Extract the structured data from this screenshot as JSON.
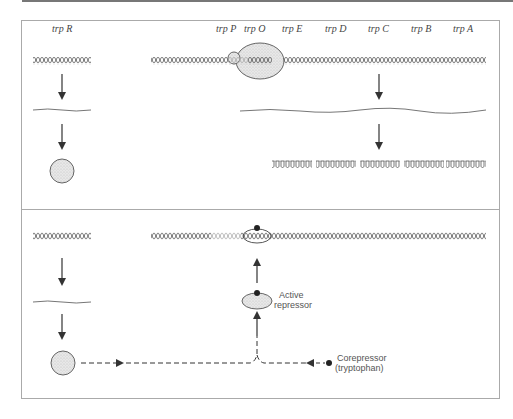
{
  "figure": {
    "top_panel": {
      "title": "Repressor inactive (no tryptophan)",
      "regulator_gene": {
        "label": "trp R"
      },
      "operon_labels": [
        "trp P",
        "trp O",
        "trp E",
        "trp D",
        "trp C",
        "trp B",
        "trp A"
      ],
      "polypeptide_count": 5
    },
    "bottom_panel": {
      "active_repressor_label_line1": "Active",
      "active_repressor_label_line2": "repressor",
      "corepressor_label_line1": "Corepressor",
      "corepressor_label_line2": "(tryptophan)"
    },
    "colors": {
      "dna_dark": "#555555",
      "dna_light": "#aaaaaa",
      "protein_fill": "#e3e3e3",
      "border": "#aaaaaa",
      "arrow": "#333333",
      "dot": "#222222"
    }
  }
}
